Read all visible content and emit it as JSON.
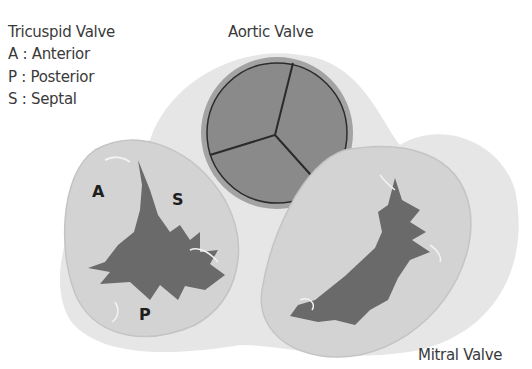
{
  "diagram": {
    "type": "anatomical-illustration",
    "labels": {
      "tricuspid_title": "Tricuspid Valve",
      "legend": [
        {
          "key": "A",
          "sep": ":",
          "text": "Anterior"
        },
        {
          "key": "P",
          "sep": ":",
          "text": "Posterior"
        },
        {
          "key": "S",
          "sep": ":",
          "text": "Septal"
        }
      ],
      "aortic": "Aortic Valve",
      "mitral": "Mitral Valve",
      "leaflets": {
        "anterior": "A",
        "septal": "S",
        "posterior": "P"
      }
    },
    "colors": {
      "background": "#ffffff",
      "annulus_fill": "#d2d2d2",
      "backdrop": "#e4e4e4",
      "leaflet_dark": "#6a6a6a",
      "aortic_fill": "#8a8a8a",
      "aortic_rim": "#a5a5a5",
      "outline": "#2c2c2c",
      "text": "#3a3a3a"
    }
  }
}
